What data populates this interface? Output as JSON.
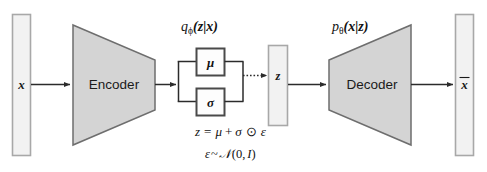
{
  "diagram": {
    "colors": {
      "trapezoid_fill": "#d4d4d4",
      "trapezoid_stroke": "#6e6e6e",
      "bar_fill": "#f2f2f2",
      "bar_stroke": "#a8a8a8",
      "param_box_fill": "#fdfdfd",
      "param_box_stroke": "#4a4a4a",
      "connector": "#2b2b2b",
      "text": "#111111",
      "background": "#ffffff"
    },
    "input": {
      "label": "x",
      "name": "input-data"
    },
    "output": {
      "label": "x",
      "overbar": true,
      "name": "reconstructed-data"
    },
    "encoder": {
      "label": "Encoder",
      "distribution": "qϕ(z|x)"
    },
    "decoder": {
      "label": "Decoder",
      "distribution": "pθ(x|z)"
    },
    "latent": {
      "label": "z"
    },
    "parameters": [
      {
        "label": "μ",
        "name": "mean"
      },
      {
        "label": "σ",
        "name": "stddev"
      }
    ],
    "equations": {
      "reparameterization": "z = μ + σ ⊙ ε",
      "noise_prior": "ε~𝒩(0, I)"
    },
    "distribution_labels": {
      "posterior_q": "q",
      "posterior_sub": "ϕ",
      "posterior_arg": "(z|x)",
      "likelihood_p": "p",
      "likelihood_sub": "θ",
      "likelihood_arg": "(x|z)"
    },
    "equation_parts": {
      "z": "z",
      "equals": "=",
      "mu": "μ",
      "plus": "+",
      "sigma": "σ",
      "hadamard": "⊙",
      "epsilon": "ε",
      "eps2": "ε",
      "tilde": "~",
      "scriptN": "𝒩",
      "paren_open": "(",
      "zero": "0",
      "comma": ",",
      "identity": "I",
      "paren_close": ")"
    }
  }
}
